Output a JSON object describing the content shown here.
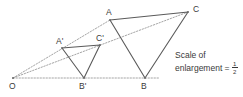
{
  "figure": {
    "background_color": "#ffffff",
    "line_color": "#4a4a4a",
    "dotted_color": "#8a8a8a",
    "text_color": "#3a3a3a",
    "width": 243,
    "height": 97
  },
  "points": {
    "O": {
      "label": "O",
      "x": 13,
      "y": 78,
      "label_x": 9,
      "label_y": 82
    },
    "A_prime": {
      "label": "A'",
      "x": 62,
      "y": 48,
      "label_x": 56,
      "label_y": 37
    },
    "B_prime": {
      "label": "B'",
      "x": 84,
      "y": 78,
      "label_x": 79,
      "label_y": 82
    },
    "C_prime": {
      "label": "C'",
      "x": 100,
      "y": 45,
      "label_x": 96,
      "label_y": 34
    },
    "A": {
      "label": "A",
      "x": 110,
      "y": 20,
      "label_x": 106,
      "label_y": 8
    },
    "B": {
      "label": "B",
      "x": 145,
      "y": 78,
      "label_x": 141,
      "label_y": 82
    },
    "C": {
      "label": "C",
      "x": 188,
      "y": 12,
      "label_x": 193,
      "label_y": 5
    }
  },
  "shapes": {
    "small_triangle": {
      "name": "triangle-a-prime-b-prime-c-prime",
      "path": "62,48 84,78 100,45",
      "style": "solid"
    },
    "large_triangle": {
      "name": "triangle-a-b-c",
      "path": "110,20 145,78 188,12",
      "style": "solid"
    }
  },
  "rays": [
    {
      "name": "ray-o-to-a",
      "from": "O",
      "through": "A_prime",
      "to": "A",
      "style": "dotted"
    },
    {
      "name": "ray-o-to-c",
      "from": "O",
      "through": "C_prime",
      "to": "C",
      "style": "dotted"
    },
    {
      "name": "ray-o-to-b",
      "from": "O",
      "through": "B_prime",
      "to": "B",
      "style": "dotted"
    }
  ],
  "caption": {
    "line1": "Scale of",
    "line2_text": "enlargement =",
    "fraction_numerator": "1",
    "fraction_denominator": "2"
  }
}
